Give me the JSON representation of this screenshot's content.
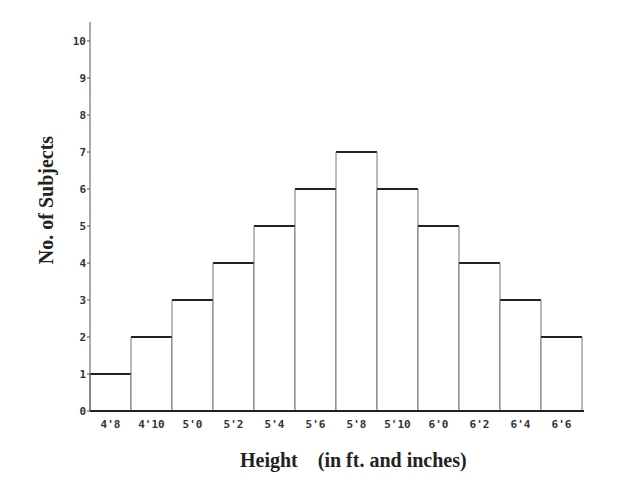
{
  "chart_data": {
    "type": "bar",
    "subtype": "histogram",
    "title": "",
    "xlabel": "Height    (in ft. and inches)",
    "xlabel_main": "Height",
    "xlabel_sub": "(in ft. and inches)",
    "ylabel": "No. of Subjects",
    "categories": [
      "4'8",
      "4'10",
      "5'0",
      "5'2",
      "5'4",
      "5'6",
      "5'8",
      "5'10",
      "6'0",
      "6'2",
      "6'4",
      "6'6"
    ],
    "values": [
      1,
      2,
      3,
      4,
      5,
      6,
      7,
      6,
      5,
      4,
      3,
      2
    ],
    "ylim": [
      0,
      10
    ],
    "yticks": [
      0,
      1,
      2,
      3,
      4,
      5,
      6,
      7,
      8,
      9,
      10
    ],
    "grid": false,
    "legend": null,
    "colors": {
      "bar_fill": "#ffffff",
      "bar_stroke": "#222222",
      "axis": "#555555"
    }
  }
}
